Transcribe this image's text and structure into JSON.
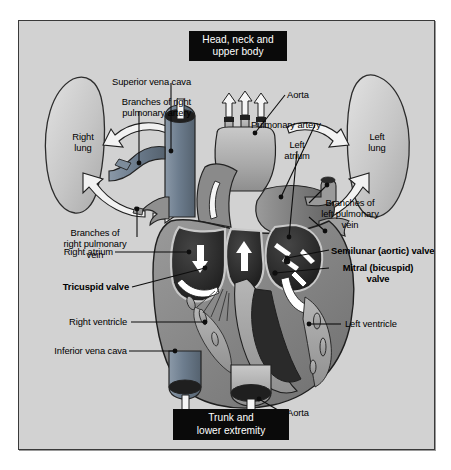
{
  "diagram": {
    "panel": {
      "background_color": "#d2d2d2",
      "border_color": "#3a3a3a"
    },
    "colors": {
      "deoxygenated_blue": "#6f7f92",
      "oxygenated_red": "#7a7a7a",
      "chamber_dark": "#2b2b2b",
      "muscle_gray": "#8d8d8d",
      "vessel_light": "#b9b9b9",
      "arrow_white": "#ffffff",
      "callout_bg": "#0a0a0a",
      "callout_text": "#ffffff"
    },
    "callouts": [
      {
        "id": "head-neck",
        "text": "Head, neck and\nupper body"
      },
      {
        "id": "trunk",
        "text": "Trunk and\nlower extremity"
      }
    ],
    "organs": [
      {
        "id": "right-lung",
        "text": "Right\nlung"
      },
      {
        "id": "left-lung",
        "text": "Left\nlung"
      }
    ],
    "labels": [
      {
        "id": "superior-vena-cava",
        "text": "Superior vena cava",
        "bold": false
      },
      {
        "id": "branches-right-pulm-artery",
        "text": "Branches of right\npulmonary artery",
        "bold": false
      },
      {
        "id": "branches-right-pulm-vein",
        "text": "Branches of\nright pulmonary\nvein",
        "bold": false
      },
      {
        "id": "right-atrium",
        "text": "Right atrium",
        "bold": false
      },
      {
        "id": "tricuspid-valve",
        "text": "Tricuspid valve",
        "bold": true
      },
      {
        "id": "right-ventricle",
        "text": "Right ventricle",
        "bold": false
      },
      {
        "id": "inferior-vena-cava",
        "text": "Inferior vena cava",
        "bold": false
      },
      {
        "id": "aorta-top",
        "text": "Aorta",
        "bold": false
      },
      {
        "id": "pulmonary-artery",
        "text": "Pulmonary artery",
        "bold": false
      },
      {
        "id": "left-atrium",
        "text": "Left\natrium",
        "bold": false
      },
      {
        "id": "branches-left-pulm-vein",
        "text": "Branches of\nleft pulmonary\nvein",
        "bold": false
      },
      {
        "id": "semilunar-aortic-valves",
        "text": "Semilunar (aortic) valves",
        "bold": true
      },
      {
        "id": "mitral-bicuspid-valve",
        "text": "Mitral (bicuspid)\nvalve",
        "bold": true
      },
      {
        "id": "left-ventricle",
        "text": "Left ventricle",
        "bold": false
      },
      {
        "id": "aorta-bottom",
        "text": "Aorta",
        "bold": false
      }
    ]
  }
}
